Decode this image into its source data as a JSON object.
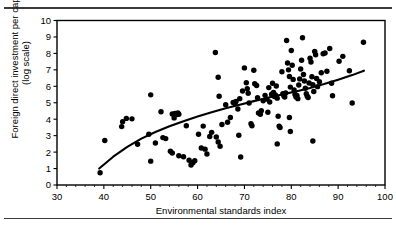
{
  "figure": {
    "rule_top": "",
    "rule_bottom": ""
  },
  "chart_data": {
    "type": "scatter",
    "title": "",
    "xlabel": "Environmental standards index",
    "ylabel": "Foreign direct investment per capita\n(log scale)",
    "ylabel_line1": "Foreign direct investment per capita",
    "ylabel_line2": "(log scale)",
    "xlim": [
      30,
      100
    ],
    "ylim": [
      0,
      10
    ],
    "xticks": [
      30,
      40,
      50,
      60,
      70,
      80,
      90,
      100
    ],
    "yticks": [
      0,
      1,
      2,
      3,
      4,
      5,
      6,
      7,
      8,
      9,
      10
    ],
    "xtick_labels": [
      "30",
      "40",
      "50",
      "60",
      "70",
      "80",
      "90",
      "100"
    ],
    "ytick_labels": [
      "0",
      "1",
      "2",
      "3",
      "4",
      "5",
      "6",
      "7",
      "8",
      "9",
      "10"
    ],
    "grid": false,
    "legend": null,
    "marker": {
      "shape": "circle",
      "color": "#000000",
      "size": 4.4
    },
    "trendline": {
      "type": "concave-log-fit",
      "color": "#000000",
      "width": 2.1,
      "points": [
        [
          39.0,
          1.0
        ],
        [
          42.0,
          1.72
        ],
        [
          45.0,
          2.32
        ],
        [
          48.0,
          2.82
        ],
        [
          51.0,
          3.22
        ],
        [
          54.0,
          3.57
        ],
        [
          57.0,
          3.88
        ],
        [
          60.0,
          4.16
        ],
        [
          63.0,
          4.42
        ],
        [
          66.0,
          4.66
        ],
        [
          69.0,
          4.88
        ],
        [
          72.0,
          5.1
        ],
        [
          75.0,
          5.3
        ],
        [
          78.0,
          5.5
        ],
        [
          81.0,
          5.69
        ],
        [
          84.0,
          5.9
        ],
        [
          87.0,
          6.14
        ],
        [
          90.0,
          6.4
        ],
        [
          93.0,
          6.68
        ],
        [
          95.5,
          6.95
        ]
      ]
    },
    "points": [
      [
        39.2,
        0.75
      ],
      [
        40.2,
        2.7
      ],
      [
        43.8,
        3.55
      ],
      [
        44.0,
        3.85
      ],
      [
        44.8,
        4.05
      ],
      [
        46.0,
        4.02
      ],
      [
        47.2,
        2.48
      ],
      [
        49.6,
        3.08
      ],
      [
        50.0,
        5.48
      ],
      [
        50.0,
        1.45
      ],
      [
        51.0,
        2.55
      ],
      [
        52.2,
        4.45
      ],
      [
        52.6,
        2.88
      ],
      [
        53.2,
        2.82
      ],
      [
        54.6,
        4.32
      ],
      [
        55.0,
        4.08
      ],
      [
        55.2,
        4.35
      ],
      [
        55.6,
        4.28
      ],
      [
        55.8,
        4.38
      ],
      [
        56.0,
        4.3
      ],
      [
        54.2,
        2.05
      ],
      [
        54.6,
        1.95
      ],
      [
        56.0,
        1.78
      ],
      [
        57.6,
        3.6
      ],
      [
        58.2,
        1.5
      ],
      [
        58.6,
        1.22
      ],
      [
        59.0,
        1.35
      ],
      [
        59.4,
        1.48
      ],
      [
        60.2,
        3.08
      ],
      [
        61.2,
        3.58
      ],
      [
        60.8,
        2.25
      ],
      [
        61.6,
        2.18
      ],
      [
        62.0,
        1.88
      ],
      [
        63.0,
        3.2
      ],
      [
        63.8,
        8.05
      ],
      [
        64.4,
        6.55
      ],
      [
        64.6,
        5.4
      ],
      [
        64.0,
        2.92
      ],
      [
        64.4,
        2.62
      ],
      [
        64.8,
        2.35
      ],
      [
        65.2,
        3.68
      ],
      [
        66.4,
        3.82
      ],
      [
        67.0,
        4.1
      ],
      [
        67.6,
        5.02
      ],
      [
        68.0,
        4.95
      ],
      [
        68.2,
        5.08
      ],
      [
        68.6,
        4.62
      ],
      [
        68.8,
        3.02
      ],
      [
        69.2,
        1.7
      ],
      [
        69.6,
        5.72
      ],
      [
        70.0,
        7.12
      ],
      [
        70.4,
        6.22
      ],
      [
        70.6,
        5.85
      ],
      [
        70.8,
        5.58
      ],
      [
        71.0,
        4.98
      ],
      [
        71.4,
        3.72
      ],
      [
        71.6,
        3.6
      ],
      [
        72.0,
        6.98
      ],
      [
        72.2,
        6.15
      ],
      [
        72.6,
        6.05
      ],
      [
        72.8,
        5.3
      ],
      [
        73.0,
        4.38
      ],
      [
        73.4,
        4.3
      ],
      [
        73.6,
        4.52
      ],
      [
        74.0,
        5.12
      ],
      [
        74.4,
        5.45
      ],
      [
        74.8,
        5.22
      ],
      [
        75.0,
        4.42
      ],
      [
        75.4,
        5.05
      ],
      [
        75.8,
        5.52
      ],
      [
        76.0,
        6.18
      ],
      [
        76.2,
        5.62
      ],
      [
        76.4,
        5.38
      ],
      [
        76.6,
        5.48
      ],
      [
        76.8,
        6.02
      ],
      [
        77.0,
        5.28
      ],
      [
        77.2,
        4.18
      ],
      [
        77.4,
        3.58
      ],
      [
        77.6,
        3.5
      ],
      [
        77.0,
        2.5
      ],
      [
        78.0,
        6.88
      ],
      [
        78.2,
        5.55
      ],
      [
        78.4,
        5.42
      ],
      [
        78.6,
        5.35
      ],
      [
        78.8,
        5.6
      ],
      [
        79.0,
        8.78
      ],
      [
        79.2,
        7.42
      ],
      [
        79.4,
        7.0
      ],
      [
        79.6,
        6.6
      ],
      [
        79.8,
        5.95
      ],
      [
        79.6,
        4.1
      ],
      [
        79.8,
        3.25
      ],
      [
        80.0,
        8.18
      ],
      [
        80.2,
        7.28
      ],
      [
        80.4,
        6.42
      ],
      [
        80.6,
        5.78
      ],
      [
        80.8,
        5.5
      ],
      [
        81.0,
        5.35
      ],
      [
        81.2,
        5.45
      ],
      [
        81.4,
        5.25
      ],
      [
        81.6,
        6.08
      ],
      [
        81.8,
        6.45
      ],
      [
        82.0,
        7.05
      ],
      [
        82.2,
        7.58
      ],
      [
        82.4,
        8.95
      ],
      [
        82.6,
        6.72
      ],
      [
        82.8,
        6.32
      ],
      [
        83.0,
        5.88
      ],
      [
        83.2,
        5.55
      ],
      [
        83.4,
        5.4
      ],
      [
        83.6,
        5.32
      ],
      [
        83.8,
        6.2
      ],
      [
        84.0,
        7.7
      ],
      [
        84.2,
        7.48
      ],
      [
        84.4,
        6.58
      ],
      [
        84.6,
        6.1
      ],
      [
        84.8,
        5.68
      ],
      [
        84.6,
        2.68
      ],
      [
        85.0,
        8.12
      ],
      [
        85.2,
        7.92
      ],
      [
        85.4,
        6.48
      ],
      [
        85.6,
        5.98
      ],
      [
        86.0,
        6.28
      ],
      [
        86.4,
        6.82
      ],
      [
        86.8,
        7.98
      ],
      [
        87.2,
        8.02
      ],
      [
        87.6,
        6.92
      ],
      [
        88.2,
        8.3
      ],
      [
        88.6,
        6.18
      ],
      [
        88.8,
        5.42
      ],
      [
        90.2,
        7.52
      ],
      [
        91.0,
        7.82
      ],
      [
        92.4,
        6.95
      ],
      [
        93.0,
        4.98
      ],
      [
        95.4,
        8.68
      ],
      [
        66.0,
        4.88
      ],
      [
        62.6,
        2.95
      ],
      [
        57.0,
        1.72
      ],
      [
        69.0,
        5.25
      ],
      [
        75.2,
        5.92
      ]
    ]
  }
}
